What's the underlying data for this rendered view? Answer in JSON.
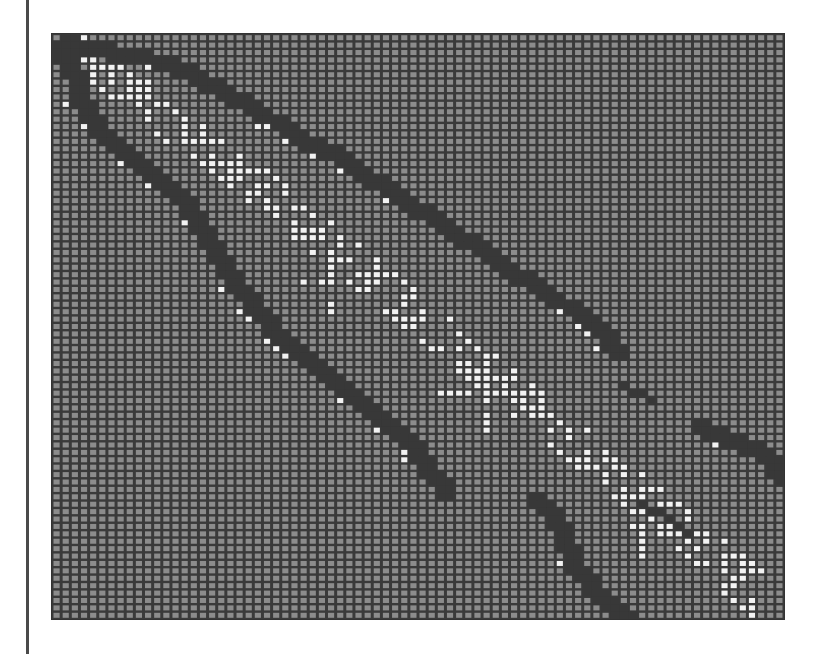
{
  "chart_data": {
    "type": "heatmap",
    "title": "",
    "xlabel": "",
    "ylabel": "",
    "description": "Sparse matrix structure plot: ~80x79 grid of cells; gray = zero/background, white = diagonal-band entries, dark = off-diagonal block bands",
    "grid": {
      "cols": 80,
      "rows": 79
    },
    "colors": {
      "background_cell": "#8c8c8c",
      "grid_line": "#3a3a3a",
      "white_cell": "#f2f2f2",
      "dark_cell": "#383838"
    },
    "white_diagonal": {
      "anchors": [
        [
          0,
          0
        ],
        [
          10,
          9
        ],
        [
          20,
          18
        ],
        [
          30,
          28
        ],
        [
          40,
          38
        ],
        [
          50,
          48
        ],
        [
          60,
          58
        ],
        [
          70,
          68
        ],
        [
          79,
          78
        ]
      ],
      "spread": 3,
      "density": 0.42
    },
    "white_crosses": [
      {
        "col": 30,
        "row": 33,
        "arm": 4
      },
      {
        "col": 47,
        "row": 48,
        "arm": 5
      },
      {
        "col": 64,
        "row": 66,
        "arm": 4
      }
    ],
    "dark_bands": [
      {
        "name": "upper-band",
        "width": 2,
        "anchors": [
          [
            1,
            0
          ],
          [
            3,
            1
          ],
          [
            12,
            3
          ],
          [
            21,
            9
          ],
          [
            26,
            13
          ],
          [
            31,
            16
          ],
          [
            37,
            21
          ],
          [
            42,
            25
          ],
          [
            47,
            29
          ],
          [
            53,
            34
          ],
          [
            58,
            38
          ],
          [
            61,
            42
          ]
        ]
      },
      {
        "name": "middle-band",
        "width": 2,
        "anchors": [
          [
            2,
            8
          ],
          [
            5,
            13
          ],
          [
            12,
            20
          ],
          [
            15,
            24
          ],
          [
            18,
            31
          ],
          [
            22,
            37
          ],
          [
            24,
            40
          ],
          [
            29,
            45
          ],
          [
            32,
            48
          ],
          [
            38,
            54
          ],
          [
            41,
            59
          ],
          [
            42,
            61
          ]
        ]
      },
      {
        "name": "lower-band",
        "width": 2,
        "anchors": [
          [
            52,
            62
          ],
          [
            55,
            66
          ],
          [
            56,
            71
          ],
          [
            59,
            75
          ],
          [
            62,
            78
          ]
        ]
      },
      {
        "name": "right-upper-band",
        "width": 1,
        "anchors": [
          [
            62,
            47
          ],
          [
            65,
            49
          ]
        ]
      },
      {
        "name": "right-band",
        "width": 2,
        "anchors": [
          [
            70,
            52
          ],
          [
            74,
            54
          ],
          [
            77,
            56
          ],
          [
            79,
            59
          ]
        ]
      },
      {
        "name": "right-lower-band",
        "width": 1,
        "anchors": [
          [
            64,
            63
          ],
          [
            67,
            65
          ],
          [
            69,
            67
          ]
        ]
      },
      {
        "name": "top-left-block",
        "width": 2,
        "anchors": [
          [
            0,
            1
          ],
          [
            1,
            4
          ],
          [
            2,
            6
          ]
        ]
      }
    ]
  }
}
